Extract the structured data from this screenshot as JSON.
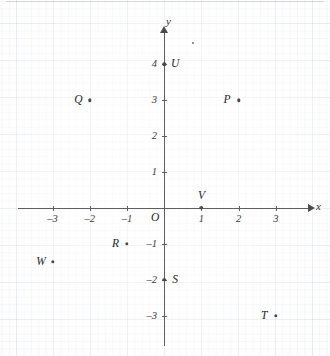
{
  "figure": {
    "type": "coordinate-plane",
    "axis_labels": {
      "x": "x",
      "y": "y"
    },
    "origin_label": "O",
    "x_ticks": [
      "-3",
      "-2",
      "-1",
      "1",
      "2",
      "3"
    ],
    "y_ticks": [
      "4",
      "3",
      "2",
      "1",
      "-1",
      "-2",
      "-3"
    ],
    "colors": {
      "axis": "#5d5d63",
      "point": "#4a4a50",
      "text": "#25252b",
      "grid": "#96a5b9"
    }
  },
  "chart_data": {
    "type": "scatter",
    "title": "",
    "xlabel": "x",
    "ylabel": "y",
    "xlim": [
      -3.9,
      3.9
    ],
    "ylim": [
      -3.6,
      4.6
    ],
    "xticks": [
      -3,
      -2,
      -1,
      1,
      2,
      3
    ],
    "yticks": [
      4,
      3,
      2,
      1,
      -1,
      -2,
      -3
    ],
    "grid": true,
    "legend": "none",
    "points": [
      {
        "label": "P",
        "x": 2,
        "y": 3,
        "label_side": "left"
      },
      {
        "label": "Q",
        "x": -2,
        "y": 3,
        "label_side": "left"
      },
      {
        "label": "R",
        "x": -1,
        "y": -1,
        "label_side": "left"
      },
      {
        "label": "S",
        "x": 0,
        "y": -2,
        "label_side": "right"
      },
      {
        "label": "T",
        "x": 3,
        "y": -3,
        "label_side": "left"
      },
      {
        "label": "U",
        "x": 0,
        "y": 4,
        "label_side": "right"
      },
      {
        "label": "V",
        "x": 1,
        "y": 0,
        "label_side": "above"
      },
      {
        "label": "W",
        "x": -3,
        "y": -1.5,
        "label_side": "left"
      }
    ],
    "unlabeled_marks": [
      {
        "x": 0.78,
        "y": 4.6
      }
    ]
  }
}
